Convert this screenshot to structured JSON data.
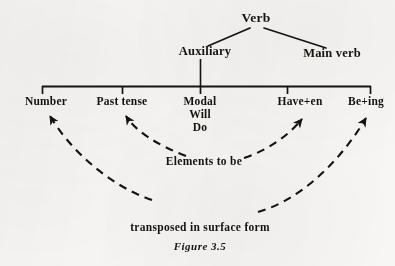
{
  "figure": {
    "caption": "Figure 3.5",
    "ink_color": "#16130f",
    "paper_color": "#f7f6f4"
  },
  "tree": {
    "root": {
      "label": "Verb",
      "x": 256,
      "y": 18
    },
    "level2": [
      {
        "name": "auxiliary",
        "label": "Auxiliary",
        "x": 205,
        "y": 50
      },
      {
        "name": "main-verb",
        "label": "Main verb",
        "x": 332,
        "y": 52
      }
    ],
    "level3": [
      {
        "name": "number",
        "label": "Number",
        "sub": "",
        "x": 46,
        "y": 96,
        "tick_x": 42
      },
      {
        "name": "past-tense",
        "label": "Past tense",
        "sub": "",
        "x": 122,
        "y": 96,
        "tick_x": 122
      },
      {
        "name": "modal",
        "label": "Modal",
        "sub": "Will",
        "sub2": "Do",
        "x": 200,
        "y": 96,
        "tick_x": 200
      },
      {
        "name": "have-en",
        "label": "Have+en",
        "sub": "",
        "x": 300,
        "y": 96,
        "tick_x": 287
      },
      {
        "name": "be-ing",
        "label": "Be+ing",
        "sub": "",
        "x": 366,
        "y": 96,
        "tick_x": 371
      }
    ],
    "bar": {
      "x1": 42,
      "x2": 371,
      "y": 86
    }
  },
  "annotations": [
    {
      "name": "elements-to-be",
      "text": "Elements to be",
      "x": 204,
      "y": 160
    },
    {
      "name": "transposed-in-surface-form",
      "text": "transposed in surface form",
      "x": 200,
      "y": 227
    }
  ],
  "arrows": [
    {
      "name": "arrow-to-number",
      "target": "Number",
      "direction": "up-left"
    },
    {
      "name": "arrow-to-past-tense",
      "target": "Past tense",
      "direction": "up-left"
    },
    {
      "name": "arrow-to-have-en",
      "target": "Have+en",
      "direction": "up-right"
    },
    {
      "name": "arrow-to-be-ing",
      "target": "Be+ing",
      "direction": "up-right"
    }
  ]
}
